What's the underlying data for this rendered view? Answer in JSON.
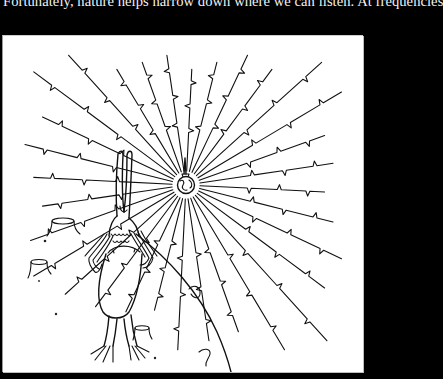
{
  "page": {
    "background_color": "#000000",
    "text_color": "#f2f2f2"
  },
  "caption": {
    "text": "Fortunately, nature helps narrow down where we can listen. At frequencies"
  },
  "illustration": {
    "description": "Line drawing of an alien creature with raised arms standing on a planet surface, facing a small globe with an antenna that radiates signal rays outward in all directions",
    "background_color": "#ffffff",
    "ink_color": "#111111",
    "elements": [
      {
        "name": "globe-with-antenna",
        "role": "central radio source"
      },
      {
        "name": "signal-rays",
        "count": 32,
        "style": "straight lines with zig-zag pulse notches"
      },
      {
        "name": "alien-creature",
        "pose": "arms raised, long eye stalks"
      },
      {
        "name": "planet-surface",
        "style": "curved horizon arc"
      },
      {
        "name": "stumps",
        "count": 3
      },
      {
        "name": "craters-and-pebbles",
        "count": 5
      }
    ]
  }
}
